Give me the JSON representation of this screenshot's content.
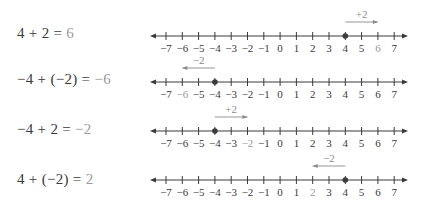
{
  "axis": {
    "min": -7,
    "max": 7,
    "tick_labels": [
      "−7",
      "−6",
      "−5",
      "−4",
      "−3",
      "−2",
      "−1",
      "0",
      "1",
      "2",
      "3",
      "4",
      "5",
      "6",
      "7"
    ]
  },
  "colors": {
    "ink": "#3a3a3a",
    "result": "#9a9a9a",
    "arrow": "#8a8a8a"
  },
  "rows": [
    {
      "lhs": "4 + 2 = ",
      "result": "6",
      "start": 4,
      "step": 2,
      "end": 6,
      "step_label": "+2"
    },
    {
      "lhs": "−4 + (−2) = ",
      "result": "−6",
      "start": -4,
      "step": -2,
      "end": -6,
      "step_label": "−2"
    },
    {
      "lhs": "−4 + 2 = ",
      "result": "−2",
      "start": -4,
      "step": 2,
      "end": -2,
      "step_label": "+2"
    },
    {
      "lhs": "4 + (−2) = ",
      "result": "2",
      "start": 4,
      "step": -2,
      "end": 2,
      "step_label": "−2"
    }
  ]
}
